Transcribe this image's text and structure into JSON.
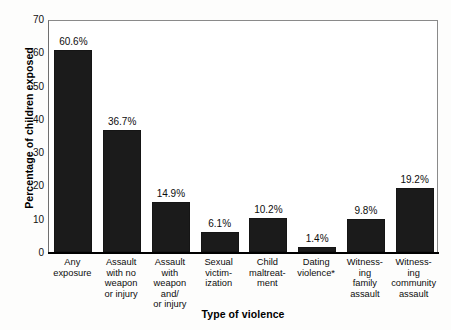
{
  "chart_data": {
    "type": "bar",
    "title": "",
    "xlabel": "Type of violence",
    "ylabel": "Percentage of children exposed",
    "ylim": [
      0,
      70
    ],
    "yticks": [
      70,
      60,
      50,
      40,
      30,
      20,
      10,
      0
    ],
    "grid": false,
    "legend": null,
    "bar_color": "#1b1b1b",
    "frame_color": "#6f6f6f",
    "categories": [
      "Any exposure",
      "Assault with no weapon or injury",
      "Assault with weapon and/ or injury",
      "Sexual victimization",
      "Child maltreatment",
      "Dating violence*",
      "Witnessing family assault",
      "Witnessing community assault"
    ],
    "category_lines": [
      [
        "Any",
        "exposure"
      ],
      [
        "Assault",
        "with no",
        "weapon",
        "or injury"
      ],
      [
        "Assault",
        "with",
        "weapon",
        "and/",
        "or injury"
      ],
      [
        "Sexual",
        "victim-",
        "ization"
      ],
      [
        "Child",
        "maltreat-",
        "ment"
      ],
      [
        "Dating",
        "violence*"
      ],
      [
        "Witness-",
        "ing",
        "family",
        "assault"
      ],
      [
        "Witness-",
        "ing",
        "community",
        "assault"
      ]
    ],
    "values": [
      60.6,
      36.7,
      14.9,
      6.1,
      10.2,
      1.4,
      9.8,
      19.2
    ],
    "value_labels": [
      "60.6%",
      "36.7%",
      "14.9%",
      "6.1%",
      "10.2%",
      "1.4%",
      "9.8%",
      "19.2%"
    ]
  }
}
